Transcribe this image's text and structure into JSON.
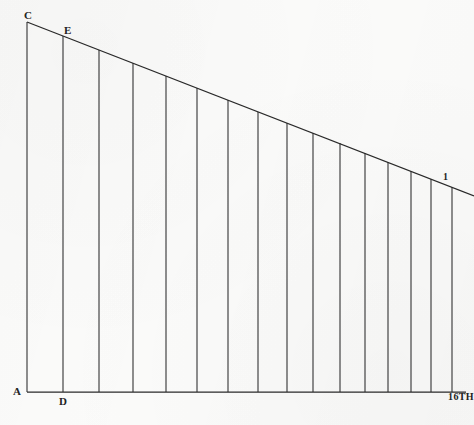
{
  "figure": {
    "kind": "geometry-diagram",
    "background_color": "#fbfbfa",
    "ink_color": "#2a2a2a"
  },
  "labels": {
    "apex": "C",
    "second_vertex": "E",
    "origin": "A",
    "foot": "D",
    "tick_mark": "1",
    "bottom_right": "16TH"
  },
  "chart_data": {
    "type": "line",
    "title": "",
    "xlabel": "",
    "ylabel": "",
    "grid": false,
    "legend": null,
    "xlim": [
      27,
      474
    ],
    "ylim": [
      0,
      370
    ],
    "outline": {
      "vertex_A": [
        27,
        392
      ],
      "vertex_C": [
        27,
        22
      ],
      "baseline_end": [
        466,
        392
      ],
      "hypotenuse_start": [
        27,
        22
      ],
      "hypotenuse_end": [
        474,
        196
      ]
    },
    "ordinates": {
      "note": "vertical lines from baseline up to the hypotenuse",
      "x": [
        27,
        63,
        99,
        133,
        166,
        197,
        228,
        258,
        287,
        313,
        340,
        365,
        388,
        411,
        431,
        452
      ],
      "top_y": [
        22,
        36,
        50,
        63,
        76,
        88,
        100,
        112,
        123,
        133,
        143,
        153,
        162,
        171,
        179,
        187
      ],
      "baseline_y": 392
    }
  }
}
